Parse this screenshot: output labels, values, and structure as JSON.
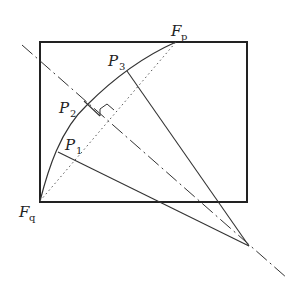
{
  "diagram": {
    "colors": {
      "stroke": "#222222",
      "background": "#ffffff"
    },
    "rectangle": {
      "x": 40,
      "y": 42,
      "width": 207,
      "height": 160
    },
    "vertex": {
      "x": 249,
      "y": 246
    },
    "arc": {
      "from": "F_q",
      "to": "F_p",
      "via": [
        "P_1",
        "P_2",
        "P_3"
      ]
    },
    "points": {
      "Fq": {
        "x": 40,
        "y": 201,
        "label": "F",
        "sub": "q"
      },
      "Fp": {
        "x": 176,
        "y": 42,
        "label": "F",
        "sub": "p"
      },
      "P1": {
        "x": 58,
        "y": 152,
        "label": "P",
        "sub": "1"
      },
      "P2": {
        "x": 87,
        "y": 105,
        "label": "P",
        "sub": "2"
      },
      "P3": {
        "x": 127,
        "y": 71,
        "label": "P",
        "sub": "3"
      }
    },
    "lines": [
      {
        "name": "chord-Fq-Fp",
        "style": "dotted"
      },
      {
        "name": "axis",
        "style": "dash-dot",
        "from": [
          22,
          45
        ],
        "to": [
          287,
          278
        ]
      },
      {
        "name": "ray-P1-vertex",
        "style": "solid"
      },
      {
        "name": "ray-P3-vertex",
        "style": "solid"
      },
      {
        "name": "segment-P2-axis",
        "style": "solid"
      }
    ],
    "annotations": [
      "right-angle-mark"
    ]
  }
}
